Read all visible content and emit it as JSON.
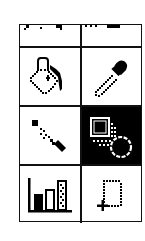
{
  "palette": {
    "name": "Tool palette",
    "colors": {
      "border": "#111111",
      "background": "#ffffff",
      "selected_background": "#000000",
      "icon_ink": "#000000",
      "selected_icon_ink": "#ffffff"
    },
    "selected_tool": "shape",
    "rows": [
      {
        "partial": true,
        "tools": [
          {
            "id": "partial-tool-left",
            "icon": "cut-off-icon"
          },
          {
            "id": "partial-tool-right",
            "icon": "cut-off-icon"
          }
        ]
      },
      {
        "tools": [
          {
            "id": "paint-bucket",
            "icon": "paint-bucket-icon",
            "selected": false
          },
          {
            "id": "eyedropper",
            "icon": "eyedropper-icon",
            "selected": false
          }
        ]
      },
      {
        "tools": [
          {
            "id": "line",
            "icon": "line-tool-icon",
            "selected": false
          },
          {
            "id": "shape",
            "icon": "shapes-icon",
            "selected": true
          }
        ]
      },
      {
        "tools": [
          {
            "id": "chart",
            "icon": "bar-chart-icon",
            "selected": false
          },
          {
            "id": "marquee-select",
            "icon": "marquee-select-icon",
            "selected": false
          }
        ]
      }
    ]
  }
}
